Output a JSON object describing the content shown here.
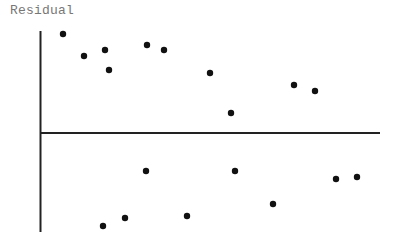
{
  "chart_data": {
    "type": "scatter",
    "title": "",
    "xlabel": "",
    "ylabel": "Residual",
    "grid": false,
    "legend": null,
    "zero_line": true,
    "xlim": [
      0,
      340
    ],
    "ylim": [
      -100,
      100
    ],
    "points": [
      {
        "x": 22,
        "y": 99
      },
      {
        "x": 43,
        "y": 77
      },
      {
        "x": 64,
        "y": 83
      },
      {
        "x": 68,
        "y": 63
      },
      {
        "x": 106,
        "y": 88
      },
      {
        "x": 123,
        "y": 83
      },
      {
        "x": 169,
        "y": 60
      },
      {
        "x": 190,
        "y": 20
      },
      {
        "x": 253,
        "y": 48
      },
      {
        "x": 274,
        "y": 42
      },
      {
        "x": 105,
        "y": -38
      },
      {
        "x": 194,
        "y": -38
      },
      {
        "x": 62,
        "y": -93
      },
      {
        "x": 84,
        "y": -85
      },
      {
        "x": 146,
        "y": -83
      },
      {
        "x": 232,
        "y": -71
      },
      {
        "x": 295,
        "y": -46
      },
      {
        "x": 316,
        "y": -44
      }
    ]
  },
  "axis": {
    "ylabel_text": "Residual",
    "color": "#222222",
    "point_color": "#111111"
  }
}
